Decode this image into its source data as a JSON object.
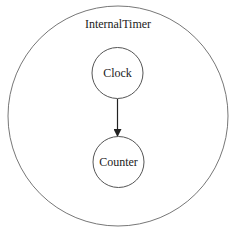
{
  "diagram": {
    "container": {
      "label": "InternalTimer",
      "stroke": "#666666"
    },
    "nodes": [
      {
        "id": "clock",
        "label": "Clock"
      },
      {
        "id": "counter",
        "label": "Counter"
      }
    ],
    "edges": [
      {
        "from": "clock",
        "to": "counter"
      }
    ],
    "colors": {
      "stroke": "#555555",
      "text": "#222222",
      "background": "#ffffff"
    }
  }
}
